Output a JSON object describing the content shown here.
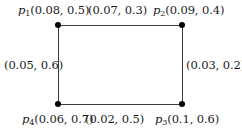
{
  "figure": {
    "type": "labeled-rectangle-graph",
    "background_color": "#ffffff",
    "node_color": "#000000",
    "edge_color": "#3a3a3a",
    "text_color": "#1a1a1a"
  },
  "nodes": [
    {
      "id": "p1",
      "symbol": "p",
      "subscript": "1",
      "position": "top-left",
      "values_text": "(0.08, 0.5)",
      "values": [
        0.08,
        0.5
      ]
    },
    {
      "id": "p2",
      "symbol": "p",
      "subscript": "2",
      "position": "top-right",
      "values_text": "(0.09, 0.4)",
      "values": [
        0.09,
        0.4
      ]
    },
    {
      "id": "p3",
      "symbol": "p",
      "subscript": "3",
      "position": "bottom-right",
      "values_text": "(0.1, 0.6)",
      "values": [
        0.1,
        0.6
      ]
    },
    {
      "id": "p4",
      "symbol": "p",
      "subscript": "4",
      "position": "bottom-left",
      "values_text": "(0.06, 0.7)",
      "values": [
        0.06,
        0.7
      ]
    }
  ],
  "edges": [
    {
      "id": "edge-top",
      "between": "p1-p2",
      "label_text": "(0.07, 0.3)",
      "values": [
        0.07,
        0.3
      ]
    },
    {
      "id": "edge-right",
      "between": "p2-p3",
      "label_text": "(0.03, 0.2)",
      "values": [
        0.03,
        0.2
      ]
    },
    {
      "id": "edge-bottom",
      "between": "p4-p3",
      "label_text": "(0.02, 0.5)",
      "values": [
        0.02,
        0.5
      ]
    },
    {
      "id": "edge-left",
      "between": "p1-p4",
      "label_text": "(0.05, 0.6)",
      "values": [
        0.05,
        0.6
      ]
    }
  ]
}
